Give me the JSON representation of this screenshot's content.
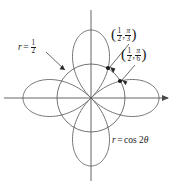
{
  "figure": {
    "name": "polar-rose-four-petal-diagram",
    "background_color": "#ffffff",
    "stroke_color": "#4a4a4a",
    "axis_color": "#4a4a4a",
    "text_color": "#1a1a1a",
    "width": 182,
    "height": 185
  },
  "axes": {
    "origin_x": 91,
    "origin_y": 98,
    "x_axis": {
      "name": "x-axis",
      "x_start": 4,
      "x_end": 174,
      "y": 98,
      "arrow_end": "right"
    },
    "y_axis": {
      "name": "y-axis",
      "x": 91,
      "y_start": 10,
      "y_end": 181,
      "arrow_end": "none"
    }
  },
  "labels": {
    "circle_equation": {
      "r": "r",
      "equals": "=",
      "numerator": "1",
      "denominator": "2"
    },
    "point_pi_over_3": {
      "open_paren": "(",
      "r_num": "1",
      "r_den": "2",
      "comma": ",",
      "theta_num": "π",
      "theta_den": "3",
      "close_paren": ")"
    },
    "point_pi_over_6": {
      "open_paren": "(",
      "r_num": "1",
      "r_den": "2",
      "comma": ",",
      "theta_num": "π",
      "theta_den": "6",
      "close_paren": ")"
    },
    "rose_equation": {
      "r": "r",
      "equals": "=",
      "expression": "cos 2",
      "theta": "θ"
    }
  },
  "chart_data": {
    "type": "line",
    "title": "",
    "xlabel": "",
    "ylabel": "",
    "coordinate_system": "polar",
    "curves": [
      {
        "name": "four-petaled-rose",
        "equation": "r = cos 2θ",
        "petal_count": 4,
        "max_radius_px": 68,
        "max_radius_units": 1,
        "petal_axis_angles_deg": [
          0,
          90,
          180,
          270
        ]
      },
      {
        "name": "circle-r-one-half",
        "equation": "r = 1/2",
        "radius_px": 34,
        "radius_units": 0.5
      }
    ],
    "marked_points": [
      {
        "name": "intersection-point-pi-over-3",
        "r": 0.5,
        "theta_deg": 60,
        "theta_label": "π/3",
        "px_x": 108,
        "px_y": 68
      },
      {
        "name": "intersection-point-pi-over-6",
        "r": 0.5,
        "theta_deg": 30,
        "theta_label": "π/6",
        "px_x": 120,
        "px_y": 81
      }
    ],
    "leaders": [
      {
        "name": "leader-circle-label",
        "from_x": 46,
        "from_y": 52,
        "to_x": 65,
        "to_y": 70
      },
      {
        "name": "leader-point-pi-over-3",
        "from_x": 129,
        "from_y": 44,
        "to_x": 110,
        "to_y": 67
      },
      {
        "name": "leader-point-pi-over-6",
        "from_x": 135,
        "from_y": 65,
        "to_x": 122,
        "to_y": 80
      }
    ],
    "grid": false,
    "legend": "none",
    "axis_ticks": []
  }
}
